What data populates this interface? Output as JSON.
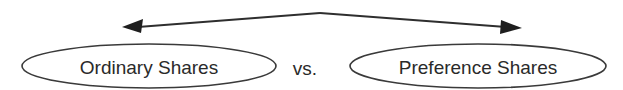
{
  "diagram": {
    "left_node": {
      "label": "Ordinary Shares",
      "cx": 149,
      "cy": 66,
      "rx": 127,
      "ry": 22
    },
    "connector": {
      "label": "vs.",
      "x": 305,
      "y": 67
    },
    "right_node": {
      "label": "Preference Shares",
      "cx": 478,
      "cy": 66,
      "rx": 128,
      "ry": 22
    },
    "arrow": {
      "style": "double-headed curved",
      "apex": [
        320,
        13
      ],
      "left_tip": [
        122,
        27
      ],
      "right_tip": [
        522,
        28
      ]
    },
    "colors": {
      "stroke": "#2e2e2e",
      "text": "#2a2a2a",
      "background": "#ffffff"
    }
  }
}
